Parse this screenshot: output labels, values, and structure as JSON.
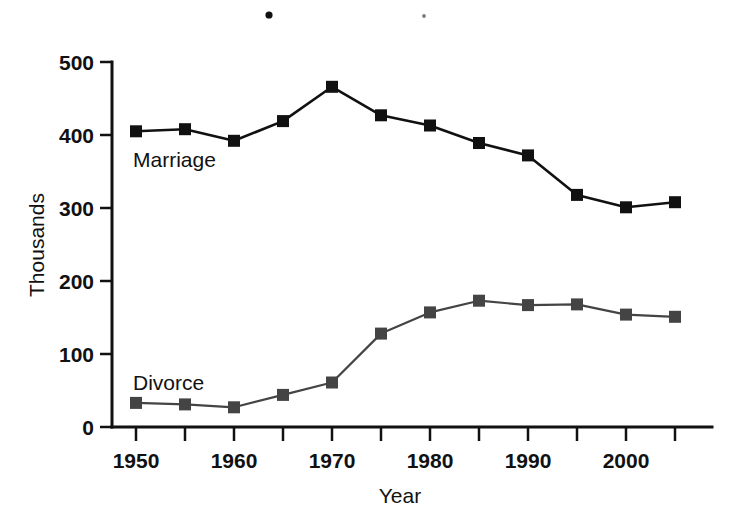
{
  "chart_data": {
    "type": "line",
    "title": "",
    "subtitle": "",
    "xlabel": "Year",
    "ylabel": "Thousands",
    "x": [
      1950,
      1955,
      1960,
      1965,
      1970,
      1975,
      1980,
      1985,
      1990,
      1995,
      2000,
      2005
    ],
    "categories": [
      "1950",
      "1955",
      "1960",
      "1965",
      "1970",
      "1975",
      "1980",
      "1985",
      "1990",
      "1995",
      "2000",
      "2005"
    ],
    "series": [
      {
        "name": "Marriage",
        "values": [
          405,
          408,
          392,
          419,
          466,
          427,
          413,
          389,
          372,
          318,
          301,
          308
        ],
        "color": "#111111",
        "marker": "square"
      },
      {
        "name": "Divorce",
        "values": [
          33,
          31,
          27,
          44,
          61,
          128,
          157,
          173,
          167,
          168,
          154,
          151
        ],
        "color": "#444444",
        "marker": "square"
      }
    ],
    "xlim": [
      1950,
      2005
    ],
    "ylim": [
      0,
      500
    ],
    "y_ticks": [
      0,
      100,
      200,
      300,
      400,
      500
    ],
    "y_tick_labels": [
      "0",
      "100",
      "200",
      "300",
      "400",
      "500"
    ],
    "x_ticks": [
      1950,
      1955,
      1960,
      1965,
      1970,
      1975,
      1980,
      1985,
      1990,
      1995,
      2000,
      2005
    ],
    "x_tick_labels_shown": [
      "1950",
      "1960",
      "1970",
      "1980",
      "1990",
      "2000"
    ],
    "x_tick_labels_shown_values": [
      1950,
      1960,
      1970,
      1980,
      1990,
      2000
    ],
    "grid": false,
    "legend_position": "inline-annotation",
    "annotations": [
      {
        "text": "Marriage",
        "x": 1950,
        "y": 355
      },
      {
        "text": "Divorce",
        "x": 1950,
        "y": 88
      }
    ]
  },
  "axes": {
    "y_axis_title": "Thousands",
    "x_axis_title": "Year",
    "y_tick_labels": [
      "500",
      "400",
      "300",
      "200",
      "100",
      "0"
    ],
    "x_tick_labels": [
      "1950",
      "1960",
      "1970",
      "1980",
      "1990",
      "2000"
    ]
  },
  "series_labels": {
    "marriage": "Marriage",
    "divorce": "Divorce"
  },
  "artifacts": {
    "speck_1": "scan-speck",
    "speck_2": "scan-speck"
  }
}
